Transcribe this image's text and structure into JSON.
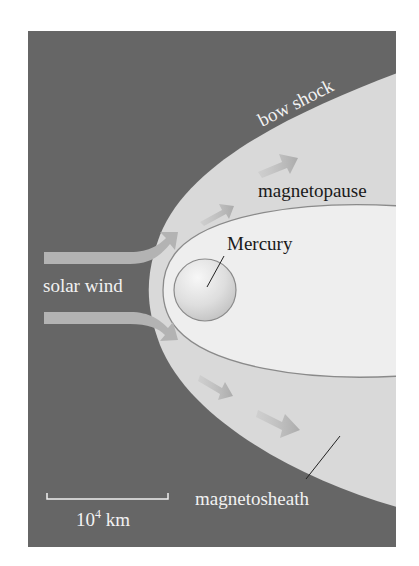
{
  "figure": {
    "labels": {
      "bow_shock": "bow shock",
      "magnetopause": "magnetopause",
      "planet": "Mercury",
      "solar_wind": "solar wind",
      "magnetosheath": "magnetosheath",
      "scale_base": "10",
      "scale_exp": "4",
      "scale_unit": " km"
    },
    "colors": {
      "space": "#666666",
      "sheath": "#d9d9d9",
      "magnetosphere": "#eeeeee",
      "boundary_line": "#8a8a8a",
      "arrow": "#b3b3b3",
      "label_light": "#f2f2f2",
      "label_dark": "#1a1a1a"
    }
  }
}
